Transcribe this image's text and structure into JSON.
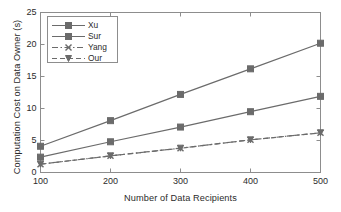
{
  "chart_data": {
    "type": "line",
    "title": "",
    "xlabel": "Number of Data Recipients",
    "ylabel": "Computation Cost on Data Owner (s)",
    "x": [
      100,
      200,
      300,
      400,
      500
    ],
    "xtick_labels": [
      "100",
      "200",
      "300",
      "400",
      "500"
    ],
    "ytick_labels": [
      "0",
      "5",
      "10",
      "15",
      "20",
      "25"
    ],
    "ytick_values": [
      0,
      5,
      10,
      15,
      20,
      25
    ],
    "xlim": [
      100,
      500
    ],
    "ylim": [
      0,
      25
    ],
    "grid": false,
    "legend_position": "upper left",
    "series": [
      {
        "name": "Xu",
        "values": [
          4.1,
          8.1,
          12.2,
          16.2,
          20.2
        ],
        "color": "#6b6b6b",
        "linestyle": "solid",
        "marker": "square"
      },
      {
        "name": "Sur",
        "values": [
          2.4,
          4.8,
          7.1,
          9.5,
          11.9
        ],
        "color": "#6b6b6b",
        "linestyle": "solid",
        "marker": "square"
      },
      {
        "name": "Yang",
        "values": [
          1.3,
          2.6,
          3.8,
          5.1,
          6.2
        ],
        "color": "#6b6b6b",
        "linestyle": "dashdot",
        "marker": "x"
      },
      {
        "name": "Our",
        "values": [
          1.3,
          2.6,
          3.8,
          5.1,
          6.2
        ],
        "color": "#6b6b6b",
        "linestyle": "dashed",
        "marker": "triangle-down"
      }
    ]
  },
  "axes": {
    "frame_color": "#8d8d8d",
    "text_color": "#2b2b2b",
    "background": "#ffffff"
  }
}
